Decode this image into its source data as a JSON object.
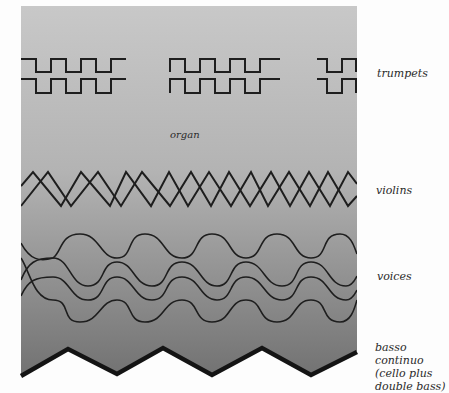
{
  "diagram": {
    "colors": {
      "panel_top": "#c6c6c6",
      "panel_bottom": "#747474",
      "line": "#1e1e1e",
      "background": "#fdfdfd"
    },
    "layers": [
      {
        "id": "trumpets",
        "label": "trumpets",
        "shape": "square-wave",
        "count": 2,
        "groups": 3
      },
      {
        "id": "organ",
        "label": "organ",
        "shape": "background-gradient"
      },
      {
        "id": "violins",
        "label": "violins",
        "shape": "zigzag",
        "count": 2
      },
      {
        "id": "voices",
        "label": "voices",
        "shape": "sine-wave",
        "count": 4
      },
      {
        "id": "basso",
        "label": "basso continuo\n(cello plus\ndouble bass)",
        "shape": "thick-zigzag-edge"
      }
    ]
  },
  "labels": {
    "trumpets": "trumpets",
    "organ": "organ",
    "violins": "violins",
    "voices": "voices",
    "basso": "basso continuo\n(cello plus\ndouble bass)"
  }
}
